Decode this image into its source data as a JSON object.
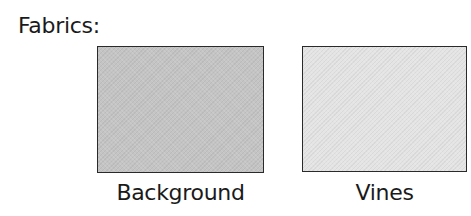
{
  "title": "Fabrics:",
  "fabrics": [
    {
      "label": "Background",
      "color": "#c4c4c4"
    },
    {
      "label": "Vines",
      "color": "#e4e4e4"
    }
  ]
}
